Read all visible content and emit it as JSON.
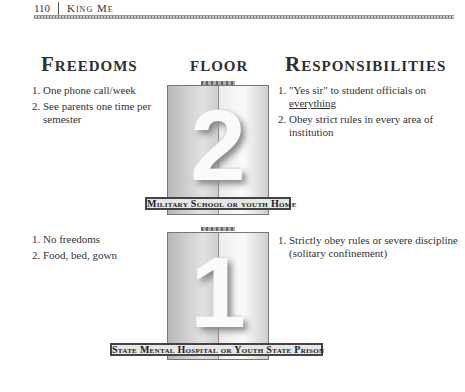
{
  "header": {
    "page_number": "110",
    "book_title": "King Me"
  },
  "columns": {
    "freedoms": "Freedoms",
    "floor": "floor",
    "responsibilities": "Responsibilities"
  },
  "floors": [
    {
      "number": "2",
      "label": "Military School or youth Home",
      "freedoms": [
        {
          "num": "1.",
          "text": "One phone call/week"
        },
        {
          "num": "2.",
          "text": "See parents one time per semester"
        }
      ],
      "responsibilities": [
        {
          "num": "1.",
          "text_pre": "\"Yes sir\" to student officials on ",
          "text_underline": "everything"
        },
        {
          "num": "2.",
          "text": "Obey strict rules in every area of institution"
        }
      ]
    },
    {
      "number": "1",
      "label": "State Mental Hospital or Youth State Prison",
      "freedoms": [
        {
          "num": "1.",
          "text": "No freedoms"
        },
        {
          "num": "2.",
          "text": "Food, bed, gown"
        }
      ],
      "responsibilities": [
        {
          "num": "1.",
          "text": "Strictly obey rules or severe discipline (solitary confinement)"
        }
      ]
    }
  ]
}
